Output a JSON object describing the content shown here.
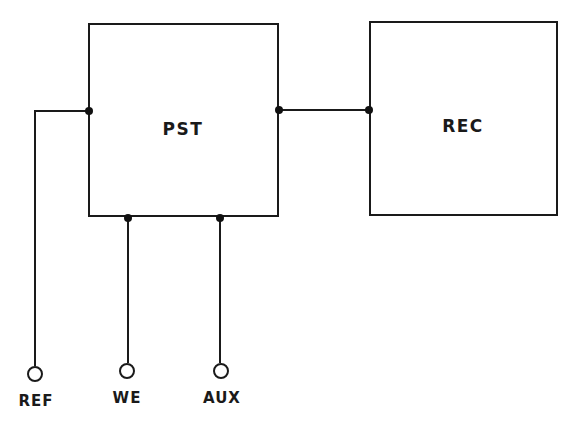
{
  "diagram": {
    "type": "block-diagram",
    "blocks": [
      {
        "id": "pst",
        "label": "PST"
      },
      {
        "id": "rec",
        "label": "REC"
      }
    ],
    "terminals": [
      {
        "id": "ref",
        "label": "REF"
      },
      {
        "id": "we",
        "label": "WE"
      },
      {
        "id": "aux",
        "label": "AUX"
      }
    ],
    "connections": [
      {
        "from": "ref",
        "to": "pst",
        "side": "left"
      },
      {
        "from": "we",
        "to": "pst",
        "side": "bottom"
      },
      {
        "from": "aux",
        "to": "pst",
        "side": "bottom"
      },
      {
        "from": "pst",
        "to": "rec",
        "side": "right"
      }
    ]
  }
}
